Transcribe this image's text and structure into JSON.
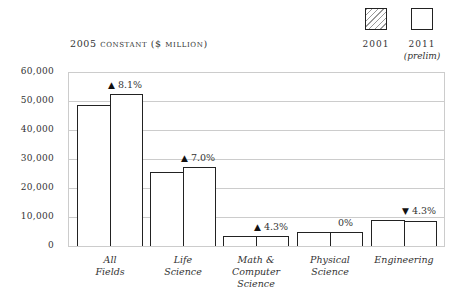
{
  "chart_data": {
    "type": "bar",
    "title": "2005 constant ($ million)",
    "xlabel": "",
    "ylabel": "2005 constant ($ million)",
    "ylim": [
      0,
      60000
    ],
    "yticks": [
      0,
      10000,
      20000,
      30000,
      40000,
      50000,
      60000
    ],
    "ytick_labels": [
      "0",
      "10,000",
      "20,000",
      "30,000",
      "40,000",
      "50,000",
      "60,000"
    ],
    "grid": true,
    "legend_position": "top-right",
    "categories": [
      "All Fields",
      "Life Science",
      "Math & Computer Science",
      "Physical Science",
      "Engineering"
    ],
    "category_labels": [
      [
        "All",
        "Fields"
      ],
      [
        "Life",
        "Science"
      ],
      [
        "Math &",
        "Computer",
        "Science"
      ],
      [
        "Physical",
        "Science"
      ],
      [
        "Engineering"
      ]
    ],
    "series": [
      {
        "name": "2001",
        "sublabel": "",
        "pattern": "hatched",
        "values": [
          48600,
          25500,
          3300,
          4800,
          9000
        ]
      },
      {
        "name": "2011",
        "sublabel": "(prelim)",
        "pattern": "open",
        "values": [
          52500,
          27300,
          3450,
          4800,
          8600
        ]
      }
    ],
    "annotations": [
      {
        "category": "All Fields",
        "direction": "up",
        "symbol": "▲",
        "text": "8.1%"
      },
      {
        "category": "Life Science",
        "direction": "up",
        "symbol": "▲",
        "text": "7.0%"
      },
      {
        "category": "Math & Computer Science",
        "direction": "up",
        "symbol": "▲",
        "text": "4.3%"
      },
      {
        "category": "Physical Science",
        "direction": "none",
        "symbol": "",
        "text": "0%"
      },
      {
        "category": "Engineering",
        "direction": "down",
        "symbol": "▼",
        "text": "4.3%"
      }
    ]
  }
}
